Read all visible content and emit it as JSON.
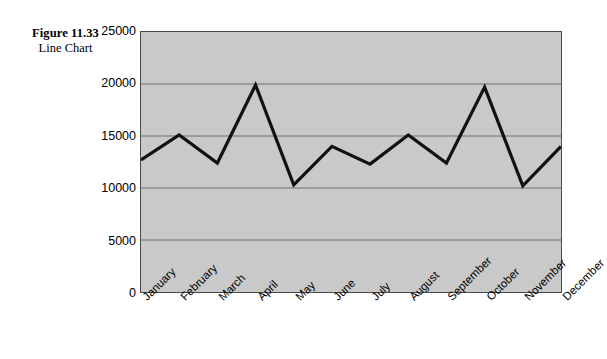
{
  "caption": {
    "figure_number": "Figure 11.33",
    "figure_name": "Line Chart"
  },
  "chart_data": {
    "type": "line",
    "title": "Line Chart",
    "xlabel": "",
    "ylabel": "",
    "categories": [
      "January",
      "February",
      "March",
      "April",
      "May",
      "June",
      "July",
      "August",
      "September",
      "October",
      "November",
      "December"
    ],
    "values": [
      12700,
      15100,
      12400,
      19900,
      10300,
      14000,
      12300,
      15100,
      12400,
      19700,
      10200,
      14000
    ],
    "series": [
      {
        "name": "Series 1",
        "values": [
          12700,
          15100,
          12400,
          19900,
          10300,
          14000,
          12300,
          15100,
          12400,
          19700,
          10200,
          14000
        ]
      }
    ],
    "ylim": [
      0,
      25000
    ],
    "y_ticks": [
      0,
      5000,
      10000,
      15000,
      20000,
      25000
    ],
    "y_tick_labels": [
      "0",
      "5000",
      "10000",
      "15000",
      "20000",
      "25000"
    ],
    "grid": true,
    "grid_axis": "y",
    "legend": false,
    "legend_position": "none",
    "colors": {
      "line": "#111111",
      "plot_background": "#c9c9c9",
      "gridline": "#6e6e6e",
      "plot_border": "#4a4a4a",
      "figure_background": "#ffffff",
      "text": "#000000"
    }
  }
}
